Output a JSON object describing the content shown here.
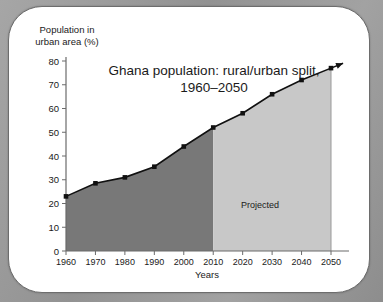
{
  "chart_data": {
    "type": "area",
    "title": "Ghana population: rural/urban split, 1960–2050",
    "title_line1": "Ghana population: rural/urban split,",
    "title_line2": "1960–2050",
    "xlabel": "Years",
    "ylabel": "Population in urban area (%)",
    "ylabel_line1": "Population in",
    "ylabel_line2": "urban area (%)",
    "categories": [
      1960,
      1970,
      1980,
      1990,
      2000,
      2010,
      2020,
      2030,
      2040,
      2050
    ],
    "values": [
      23,
      28.5,
      31,
      35.5,
      44,
      52,
      58,
      66,
      72,
      77
    ],
    "x": [
      "1960",
      "1970",
      "1980",
      "1990",
      "2000",
      "2010",
      "2020",
      "2030",
      "2040",
      "2050"
    ],
    "ytick_labels": [
      "0",
      "10",
      "20",
      "30",
      "40",
      "50",
      "60",
      "70",
      "80"
    ],
    "yticks": [
      0,
      10,
      20,
      30,
      40,
      50,
      60,
      70,
      80
    ],
    "ylim": [
      0,
      80
    ],
    "xlim": [
      1960,
      2050
    ],
    "grid": false,
    "legend_position": "none",
    "annotations": [
      {
        "text": "Projected",
        "x": 2030,
        "y": 18
      }
    ],
    "regions": [
      {
        "label": "historical",
        "from": 1960,
        "to": 2010,
        "color": "#787878"
      },
      {
        "label": "projected",
        "from": 2010,
        "to": 2050,
        "color": "#c8c8c8"
      }
    ],
    "series_color": "#111111",
    "marker": "square",
    "line_end_arrow": true
  },
  "colors": {
    "historical_fill": "#787878",
    "projected_fill": "#c8c8c8",
    "line": "#111111",
    "axis": "#6b6b6b",
    "card_background": "#ffffff",
    "page_background": "#9a9a9a"
  }
}
